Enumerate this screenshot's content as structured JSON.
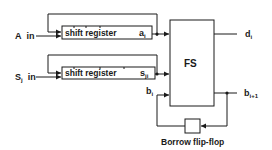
{
  "diagram": {
    "colors": {
      "line": "#1a1a1a",
      "background": "#ffffff"
    },
    "inputs": {
      "a": {
        "label": "A",
        "suffix": "in"
      },
      "s": {
        "label": "S",
        "sub": "j",
        "suffix": "in"
      }
    },
    "registers": [
      {
        "label": "shift register",
        "output": "a",
        "output_sub": "i"
      },
      {
        "label": "shift register",
        "output": "s",
        "output_sub": "ji"
      }
    ],
    "subtractor": {
      "label": "FS"
    },
    "outputs": {
      "difference": {
        "label": "d",
        "sub": "i"
      },
      "borrow_out": {
        "label": "b",
        "sub": "i+1"
      },
      "borrow_in": {
        "label": "b",
        "sub": "i"
      }
    },
    "flipflop": {
      "label": "Borrow flip-flop"
    }
  }
}
